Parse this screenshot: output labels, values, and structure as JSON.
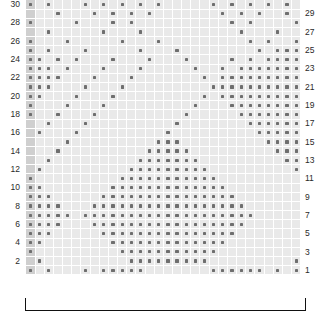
{
  "chart_data": {
    "type": "heatmap",
    "title": "",
    "xlabel": "",
    "ylabel": "",
    "columns": 30,
    "rows": 30,
    "row_labels_left": [
      30,
      28,
      26,
      24,
      22,
      20,
      18,
      16,
      14,
      12,
      10,
      8,
      6,
      4,
      2
    ],
    "row_labels_right": [
      29,
      27,
      25,
      23,
      21,
      19,
      17,
      15,
      13,
      11,
      9,
      7,
      5,
      3,
      1
    ],
    "legend": [],
    "grid": true,
    "colors": {
      "cell": "#e9e9e9",
      "selvage_cell": "#cfcfcf",
      "dot": "#6e6e6e",
      "gridline": "#ffffff",
      "label": "#2a2a2a",
      "bracket": "#111111",
      "background": "#ffffff"
    },
    "selvage_column_index": 0,
    "repeat_bracket": {
      "start_col": 1,
      "end_col": 30,
      "label": ""
    },
    "matrix": [
      [
        1,
        0,
        1,
        0,
        0,
        0,
        1,
        0,
        1,
        0,
        1,
        0,
        1,
        0,
        1,
        0,
        0,
        0,
        0,
        0,
        1,
        0,
        1,
        0,
        1,
        0,
        1,
        0,
        1,
        0
      ],
      [
        0,
        0,
        0,
        1,
        0,
        0,
        0,
        1,
        0,
        1,
        0,
        1,
        0,
        1,
        0,
        0,
        0,
        0,
        0,
        0,
        0,
        1,
        0,
        1,
        0,
        1,
        0,
        0,
        1,
        0
      ],
      [
        1,
        0,
        0,
        0,
        0,
        1,
        0,
        0,
        0,
        1,
        0,
        1,
        0,
        0,
        0,
        0,
        0,
        0,
        0,
        0,
        0,
        0,
        1,
        0,
        1,
        0,
        0,
        0,
        0,
        1
      ],
      [
        0,
        0,
        1,
        0,
        0,
        0,
        0,
        0,
        1,
        0,
        0,
        0,
        1,
        0,
        0,
        0,
        0,
        0,
        0,
        0,
        0,
        0,
        0,
        1,
        0,
        0,
        0,
        1,
        0,
        0
      ],
      [
        1,
        0,
        0,
        0,
        1,
        0,
        0,
        0,
        0,
        0,
        1,
        0,
        0,
        0,
        1,
        0,
        0,
        0,
        0,
        0,
        0,
        0,
        0,
        0,
        1,
        0,
        1,
        0,
        0,
        1
      ],
      [
        1,
        0,
        1,
        0,
        0,
        0,
        1,
        0,
        0,
        0,
        0,
        0,
        1,
        0,
        0,
        0,
        1,
        0,
        0,
        0,
        0,
        0,
        0,
        0,
        0,
        1,
        0,
        1,
        1,
        1
      ],
      [
        1,
        1,
        0,
        1,
        0,
        1,
        0,
        0,
        0,
        1,
        0,
        0,
        0,
        1,
        0,
        0,
        0,
        1,
        0,
        0,
        0,
        0,
        1,
        0,
        1,
        0,
        1,
        1,
        1,
        1
      ],
      [
        1,
        1,
        1,
        0,
        1,
        0,
        0,
        0,
        1,
        0,
        0,
        0,
        1,
        0,
        0,
        0,
        0,
        0,
        1,
        0,
        0,
        1,
        0,
        1,
        1,
        1,
        1,
        1,
        1,
        1
      ],
      [
        1,
        1,
        1,
        1,
        0,
        0,
        0,
        1,
        0,
        0,
        0,
        1,
        0,
        0,
        0,
        0,
        0,
        0,
        0,
        1,
        0,
        1,
        1,
        1,
        1,
        1,
        1,
        1,
        1,
        1
      ],
      [
        1,
        1,
        1,
        0,
        0,
        0,
        1,
        0,
        0,
        0,
        1,
        0,
        0,
        0,
        0,
        0,
        0,
        0,
        0,
        0,
        1,
        1,
        1,
        1,
        1,
        1,
        1,
        1,
        1,
        1
      ],
      [
        1,
        1,
        0,
        0,
        0,
        1,
        0,
        0,
        0,
        1,
        0,
        0,
        0,
        0,
        0,
        0,
        0,
        0,
        0,
        1,
        0,
        1,
        1,
        1,
        1,
        1,
        1,
        1,
        1,
        1
      ],
      [
        1,
        0,
        0,
        0,
        1,
        0,
        0,
        0,
        1,
        0,
        0,
        0,
        0,
        0,
        0,
        0,
        0,
        0,
        1,
        0,
        0,
        0,
        1,
        1,
        1,
        1,
        1,
        1,
        1,
        1
      ],
      [
        1,
        0,
        0,
        1,
        0,
        0,
        0,
        1,
        0,
        0,
        0,
        0,
        0,
        0,
        0,
        0,
        0,
        1,
        0,
        0,
        0,
        0,
        0,
        1,
        1,
        1,
        1,
        1,
        1,
        1
      ],
      [
        0,
        0,
        1,
        0,
        0,
        0,
        1,
        0,
        0,
        0,
        0,
        0,
        0,
        0,
        0,
        0,
        1,
        0,
        0,
        0,
        0,
        0,
        0,
        0,
        1,
        1,
        1,
        1,
        1,
        1
      ],
      [
        0,
        1,
        0,
        0,
        0,
        1,
        0,
        0,
        0,
        0,
        0,
        0,
        0,
        0,
        0,
        1,
        0,
        0,
        0,
        0,
        0,
        0,
        0,
        0,
        0,
        1,
        1,
        1,
        1,
        1
      ],
      [
        0,
        0,
        0,
        0,
        1,
        0,
        0,
        0,
        0,
        0,
        0,
        0,
        0,
        0,
        1,
        1,
        1,
        0,
        0,
        0,
        0,
        0,
        0,
        0,
        0,
        0,
        1,
        1,
        1,
        1
      ],
      [
        0,
        0,
        0,
        1,
        0,
        0,
        0,
        0,
        0,
        0,
        0,
        0,
        0,
        1,
        1,
        1,
        1,
        1,
        0,
        0,
        0,
        0,
        0,
        0,
        0,
        0,
        0,
        1,
        1,
        1
      ],
      [
        0,
        0,
        1,
        0,
        0,
        0,
        0,
        0,
        0,
        0,
        0,
        0,
        1,
        1,
        1,
        1,
        1,
        1,
        1,
        0,
        0,
        0,
        0,
        0,
        0,
        0,
        0,
        0,
        1,
        1
      ],
      [
        0,
        1,
        0,
        0,
        0,
        0,
        0,
        0,
        0,
        0,
        0,
        1,
        1,
        1,
        1,
        1,
        1,
        1,
        1,
        1,
        0,
        0,
        0,
        0,
        0,
        0,
        0,
        0,
        0,
        1
      ],
      [
        1,
        0,
        0,
        0,
        0,
        0,
        0,
        0,
        0,
        0,
        1,
        1,
        1,
        1,
        1,
        1,
        1,
        1,
        1,
        1,
        1,
        0,
        0,
        0,
        0,
        0,
        0,
        0,
        0,
        0
      ],
      [
        1,
        1,
        0,
        0,
        0,
        0,
        0,
        0,
        0,
        1,
        1,
        1,
        1,
        1,
        1,
        1,
        1,
        1,
        1,
        1,
        1,
        1,
        0,
        0,
        0,
        0,
        0,
        0,
        0,
        0
      ],
      [
        1,
        1,
        1,
        0,
        0,
        0,
        0,
        0,
        1,
        1,
        1,
        1,
        1,
        1,
        1,
        1,
        1,
        1,
        1,
        1,
        1,
        1,
        1,
        0,
        0,
        0,
        0,
        0,
        0,
        0
      ],
      [
        1,
        1,
        1,
        1,
        0,
        0,
        0,
        1,
        1,
        1,
        1,
        1,
        1,
        1,
        1,
        1,
        1,
        1,
        1,
        1,
        1,
        1,
        1,
        1,
        0,
        0,
        0,
        0,
        0,
        0
      ],
      [
        1,
        1,
        1,
        1,
        1,
        0,
        1,
        1,
        1,
        1,
        1,
        1,
        1,
        1,
        1,
        1,
        1,
        1,
        1,
        1,
        1,
        1,
        1,
        1,
        1,
        0,
        0,
        0,
        0,
        0
      ],
      [
        1,
        1,
        1,
        1,
        0,
        0,
        0,
        1,
        1,
        1,
        1,
        1,
        1,
        1,
        1,
        1,
        1,
        1,
        1,
        1,
        1,
        1,
        1,
        1,
        0,
        0,
        0,
        0,
        0,
        0
      ],
      [
        1,
        1,
        1,
        0,
        0,
        0,
        0,
        0,
        1,
        1,
        1,
        1,
        1,
        1,
        1,
        1,
        1,
        1,
        1,
        1,
        1,
        1,
        1,
        0,
        0,
        0,
        0,
        0,
        0,
        0
      ],
      [
        1,
        1,
        0,
        0,
        0,
        0,
        0,
        0,
        0,
        1,
        1,
        1,
        1,
        1,
        1,
        1,
        1,
        1,
        1,
        1,
        1,
        1,
        0,
        0,
        0,
        0,
        0,
        0,
        0,
        0
      ],
      [
        1,
        0,
        0,
        0,
        0,
        0,
        0,
        0,
        0,
        0,
        1,
        1,
        1,
        1,
        1,
        1,
        1,
        1,
        1,
        1,
        1,
        0,
        0,
        0,
        0,
        0,
        0,
        0,
        0,
        0
      ],
      [
        0,
        1,
        0,
        0,
        0,
        0,
        0,
        0,
        0,
        0,
        0,
        1,
        1,
        1,
        1,
        1,
        1,
        1,
        1,
        1,
        0,
        0,
        0,
        0,
        0,
        0,
        0,
        0,
        0,
        1
      ],
      [
        1,
        0,
        1,
        0,
        0,
        0,
        1,
        0,
        1,
        1,
        1,
        1,
        1,
        0,
        0,
        0,
        0,
        0,
        0,
        0,
        1,
        1,
        1,
        1,
        1,
        1,
        0,
        1,
        0,
        1
      ]
    ]
  }
}
